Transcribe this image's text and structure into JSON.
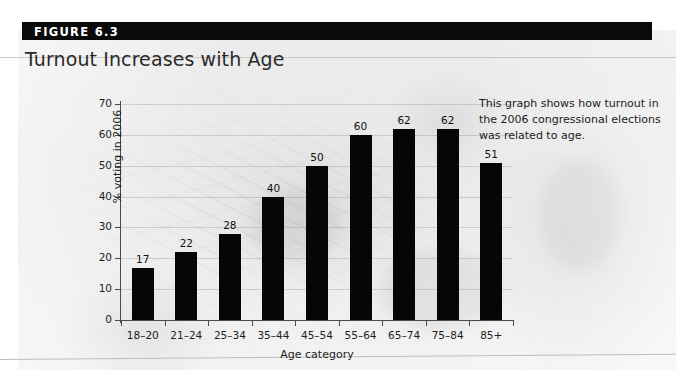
{
  "figure": {
    "number_label": "FIGURE 6.3",
    "title": "Turnout Increases with Age",
    "annotation": "This graph shows how turnout in the 2006 congressional elections was related to age."
  },
  "chart_data": {
    "type": "bar",
    "title": "Turnout Increases with Age",
    "categories": [
      "18–20",
      "21–24",
      "25–34",
      "35–44",
      "45–54",
      "55–64",
      "65–74",
      "75–84",
      "85+"
    ],
    "values": [
      17,
      22,
      28,
      40,
      50,
      60,
      62,
      62,
      51
    ],
    "value_labels": [
      "17",
      "22",
      "28",
      "40",
      "50",
      "60",
      "62",
      "62",
      "51"
    ],
    "xlabel": "Age category",
    "ylabel": "% voting in 2006",
    "ylim": [
      0,
      70
    ],
    "ytick_values": [
      0,
      10,
      20,
      30,
      40,
      50,
      60,
      70
    ],
    "ytick_labels": [
      "0",
      "10",
      "20",
      "30",
      "40",
      "50",
      "60",
      "70"
    ],
    "grid": true,
    "legend": false,
    "bar_color": "#060606"
  },
  "colors": {
    "header_bar": "#0a0a0a",
    "header_text": "#ffffff",
    "title_text": "#2b2b2b",
    "axis": "#4a4a4a",
    "background": "#ececed"
  }
}
